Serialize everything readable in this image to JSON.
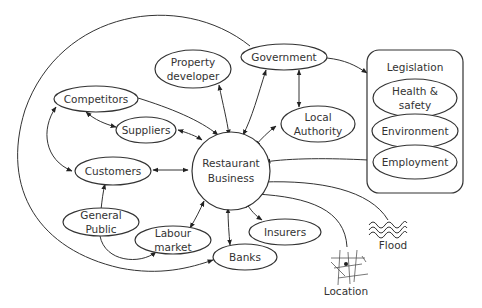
{
  "diagram": {
    "title": "",
    "center": {
      "id": "restaurant",
      "label_line1": "Restaurant",
      "label_line2": "Business"
    },
    "nodes": {
      "property_developer": {
        "line1": "Property",
        "line2": "developer"
      },
      "government": {
        "label": "Government"
      },
      "competitors": {
        "label": "Competitors"
      },
      "suppliers": {
        "label": "Suppliers"
      },
      "local_authority": {
        "line1": "Local",
        "line2": "Authority"
      },
      "customers": {
        "label": "Customers"
      },
      "general_public": {
        "line1": "General",
        "line2": "Public"
      },
      "labour_market": {
        "line1": "Labour",
        "line2": "market"
      },
      "banks": {
        "label": "Banks"
      },
      "insurers": {
        "label": "Insurers"
      },
      "flood": {
        "label": "Flood",
        "icon": "waves-icon"
      },
      "location": {
        "label": "Location",
        "icon": "map-icon"
      }
    },
    "legislation": {
      "title": "Legislation",
      "items": [
        {
          "line1": "Health &",
          "line2": "safety"
        },
        {
          "label": "Environment"
        },
        {
          "label": "Employment"
        }
      ]
    },
    "edges": [
      {
        "from": "Property developer",
        "to": "Restaurant Business",
        "type": "bidirectional"
      },
      {
        "from": "Government",
        "to": "Restaurant Business",
        "type": "bidirectional"
      },
      {
        "from": "Government",
        "to": "Local Authority",
        "type": "bidirectional"
      },
      {
        "from": "Government",
        "to": "Legislation",
        "type": "directed"
      },
      {
        "from": "Government",
        "to": "Banks",
        "type": "directed",
        "note": "outer arc"
      },
      {
        "from": "Competitors",
        "to": "Restaurant Business",
        "type": "directed"
      },
      {
        "from": "Competitors",
        "to": "Suppliers",
        "type": "bidirectional"
      },
      {
        "from": "Competitors",
        "to": "Customers",
        "type": "bidirectional"
      },
      {
        "from": "Suppliers",
        "to": "Restaurant Business",
        "type": "bidirectional"
      },
      {
        "from": "Local Authority",
        "to": "Restaurant Business",
        "type": "bidirectional"
      },
      {
        "from": "Customers",
        "to": "Restaurant Business",
        "type": "bidirectional"
      },
      {
        "from": "General Public",
        "to": "Customers",
        "type": "directed"
      },
      {
        "from": "General Public",
        "to": "Labour market",
        "type": "directed"
      },
      {
        "from": "Labour market",
        "to": "Restaurant Business",
        "type": "bidirectional"
      },
      {
        "from": "Banks",
        "to": "Restaurant Business",
        "type": "bidirectional"
      },
      {
        "from": "Insurers",
        "to": "Restaurant Business",
        "type": "bidirectional"
      },
      {
        "from": "Legislation",
        "to": "Restaurant Business",
        "type": "directed"
      },
      {
        "from": "Flood",
        "to": "Restaurant Business",
        "type": "directed"
      },
      {
        "from": "Location",
        "to": "Restaurant Business",
        "type": "directed"
      }
    ]
  }
}
